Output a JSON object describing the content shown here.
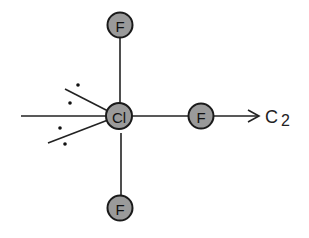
{
  "diagram": {
    "molecule": "ClF3",
    "central_atom": {
      "label": "Cl",
      "x": 119,
      "y": 116
    },
    "ligands": [
      {
        "label": "F",
        "position": "top",
        "x": 120,
        "y": 25
      },
      {
        "label": "F",
        "position": "right",
        "x": 201,
        "y": 116
      },
      {
        "label": "F",
        "position": "bottom",
        "x": 120,
        "y": 208
      }
    ],
    "axis": {
      "label": "C",
      "subscript": "2"
    },
    "lone_pairs": 2,
    "colors": {
      "atom_fill": "#9a9a9a",
      "stroke": "#1a1a1a"
    }
  }
}
